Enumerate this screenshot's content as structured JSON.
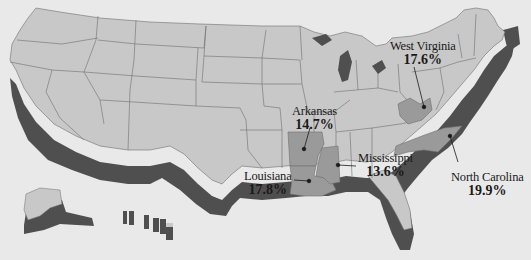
{
  "map": {
    "title": "",
    "region": "United States",
    "colors": {
      "background": "#e9e9e9",
      "land": "#c8c8c8",
      "extrusion": "#4f4f4f",
      "highlight": "#9a9a9a",
      "border": "#6e6e6e",
      "text": "#1a1a1a"
    },
    "highlighted_states": [
      {
        "name": "West Virginia",
        "value": "17.6%"
      },
      {
        "name": "Arkansas",
        "value": "14.7%"
      },
      {
        "name": "Mississippi",
        "value": "13.6%"
      },
      {
        "name": "Louisiana",
        "value": "17.8%"
      },
      {
        "name": "North Carolina",
        "value": "19.9%"
      }
    ]
  }
}
